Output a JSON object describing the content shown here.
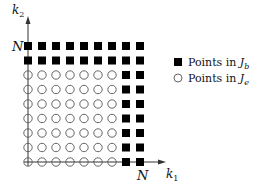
{
  "diagram": {
    "grid_size_label": "N",
    "grid_max_index": 8,
    "axes": {
      "x_label": "k",
      "x_label_sub": "1",
      "y_label": "k",
      "y_label_sub": "2",
      "x_tick_label": "N",
      "y_tick_label": "N"
    },
    "boundary_rule": "points with k1 >= N-1 or k2 >= N-1 are in J_b; others in J_e",
    "boundary_width": 2,
    "legend": [
      {
        "marker": "filled-square",
        "text": "Points in ",
        "set": "J",
        "set_sub": "b"
      },
      {
        "marker": "open-circle",
        "text": "Points in ",
        "set": "J",
        "set_sub": "e"
      }
    ],
    "colors": {
      "filled": "#000000",
      "circle_stroke": "#555555",
      "axis": "#333333"
    }
  }
}
